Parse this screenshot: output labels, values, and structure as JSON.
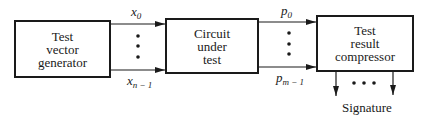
{
  "diagram": {
    "blocks": [
      {
        "id": "test-vector-generator",
        "lines": [
          "Test",
          "vector",
          "generator"
        ]
      },
      {
        "id": "circuit-under-test",
        "lines": [
          "Circuit",
          "under",
          "test"
        ]
      },
      {
        "id": "test-result-compressor",
        "lines": [
          "Test",
          "result",
          "compressor"
        ]
      }
    ],
    "inputs": {
      "first_base": "x",
      "first_sub": "0",
      "last_base": "x",
      "last_sub": "n − 1"
    },
    "outputs": {
      "first_base": "p",
      "first_sub": "0",
      "last_base": "p",
      "last_sub": "m − 1"
    },
    "ellipsis_vertical": "•",
    "ellipsis_horizontal": "• • •",
    "signature_label": "Signature",
    "colors": {
      "stroke": "#1a1a1a",
      "background": "#ffffff"
    }
  }
}
